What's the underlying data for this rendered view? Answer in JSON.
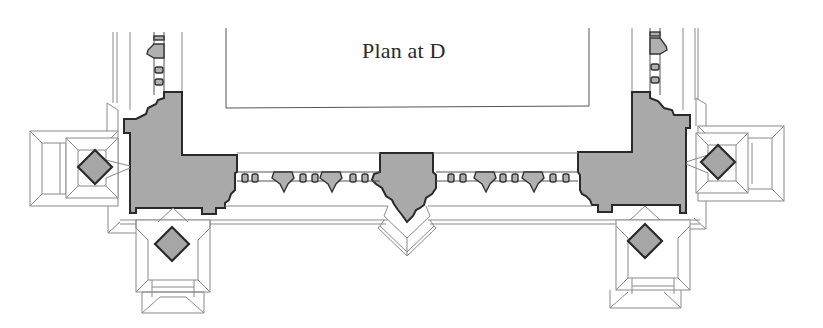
{
  "drawing": {
    "title": "Plan at D",
    "type": "architectural floor plan",
    "colors": {
      "background": "#ffffff",
      "pier_fill": "#a9a9a9",
      "pier_outline": "#2a2a2a",
      "line": "#8a8a8a",
      "text": "#2a2a2a"
    },
    "elements": {
      "piers": [
        "left-corner-pier",
        "center-pier",
        "right-corner-pier"
      ],
      "diamonds": [
        "left-outer-diamond",
        "left-lower-diamond",
        "right-outer-diamond",
        "right-lower-diamond"
      ],
      "balustrades": [
        "left-vertical-balustrade",
        "right-vertical-balustrade",
        "left-horizontal-balustrade",
        "right-horizontal-balustrade"
      ]
    }
  }
}
